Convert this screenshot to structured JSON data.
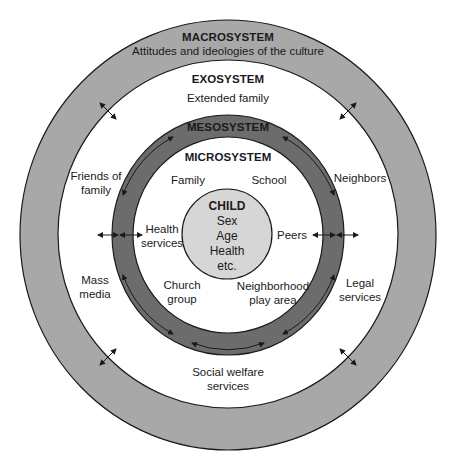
{
  "colors": {
    "macro_ring": "#a8a8a8",
    "exo_ring": "#ffffff",
    "meso_ring": "#6c6c6c",
    "micro_ring": "#ffffff",
    "child_circle": "#d6d6d6",
    "stroke": "#1a1a1a"
  },
  "systems": {
    "macro": {
      "title": "MACROSYSTEM",
      "subtitle": "Attitudes and ideologies of the culture"
    },
    "exo": {
      "title": "EXOSYSTEM",
      "items": [
        {
          "lines": [
            "Extended family"
          ]
        },
        {
          "lines": [
            "Friends of",
            "family"
          ]
        },
        {
          "lines": [
            "Neighbors"
          ]
        },
        {
          "lines": [
            "Mass",
            "media"
          ]
        },
        {
          "lines": [
            "Legal",
            "services"
          ]
        },
        {
          "lines": [
            "Social welfare",
            "services"
          ]
        }
      ]
    },
    "meso": {
      "title": "MESOSYSTEM"
    },
    "micro": {
      "title": "MICROSYSTEM",
      "items": [
        {
          "lines": [
            "Family"
          ]
        },
        {
          "lines": [
            "School"
          ]
        },
        {
          "lines": [
            "Health",
            "services"
          ]
        },
        {
          "lines": [
            "Peers"
          ]
        },
        {
          "lines": [
            "Church",
            "group"
          ]
        },
        {
          "lines": [
            "Neighborhood",
            "play area"
          ]
        }
      ]
    },
    "child": {
      "title": "CHILD",
      "attributes": [
        "Sex",
        "Age",
        "Health",
        "etc."
      ]
    }
  }
}
